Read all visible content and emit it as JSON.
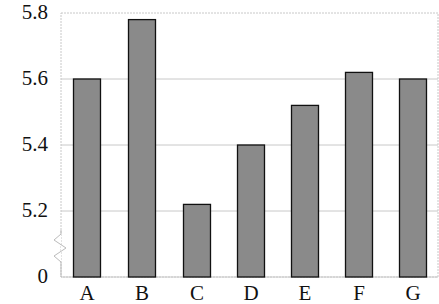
{
  "chart_data": {
    "type": "bar",
    "title": "",
    "xlabel": "",
    "ylabel": "",
    "categories": [
      "A",
      "B",
      "C",
      "D",
      "E",
      "F",
      "G"
    ],
    "values": [
      5.6,
      5.78,
      5.22,
      5.4,
      5.52,
      5.62,
      5.6
    ],
    "ylim": [
      5.1,
      5.8
    ],
    "axis_break": true,
    "yticks": [
      "0",
      "5.2",
      "5.4",
      "5.6",
      "5.8"
    ],
    "grid": true,
    "legend": null,
    "colors": {
      "bar_fill": "#8a8a8a",
      "bar_edge": "#111111",
      "grid": "#c8c8c8",
      "frame": "#c8c8c8"
    }
  }
}
